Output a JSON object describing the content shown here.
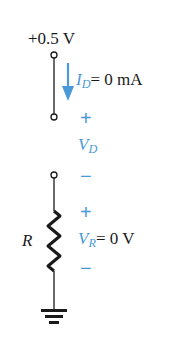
{
  "diagram": {
    "type": "series diode-resistor circuit",
    "supply": {
      "label": "+0.5 V"
    },
    "current": {
      "symbol": "I",
      "subscript": "D",
      "value": "= 0 mA"
    },
    "diode_voltage": {
      "plus": "+",
      "symbol": "V",
      "subscript": "D",
      "minus": "−"
    },
    "resistor": {
      "label": "R"
    },
    "resistor_voltage": {
      "plus": "+",
      "symbol": "V",
      "subscript": "R",
      "value": "= 0 V",
      "minus": "−"
    },
    "colors": {
      "wire": "#1a1a1a",
      "annotation": "#4a9ad8"
    }
  }
}
